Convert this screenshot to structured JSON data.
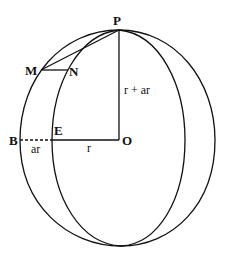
{
  "diagram": {
    "labels": {
      "P": "P",
      "M": "M",
      "N": "N",
      "E": "E",
      "B": "B",
      "O": "O",
      "polar_radius": "r + ar",
      "equatorial_extra": "ar",
      "equatorial_radius": "r"
    },
    "colors": {
      "stroke": "#111111",
      "background": "#ffffff"
    }
  }
}
